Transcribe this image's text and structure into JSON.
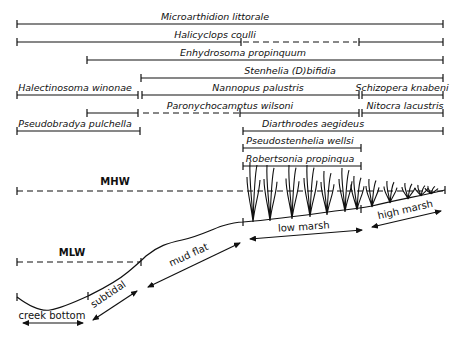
{
  "species": [
    {
      "name": "Microarthidion littorale",
      "label_x": 215,
      "y": 24,
      "segments": [
        {
          "x1": 17,
          "x2": 443,
          "style": "solid"
        }
      ]
    },
    {
      "name": "Halicyclops coulli",
      "label_x": 215,
      "y": 42,
      "segments": [
        {
          "x1": 17,
          "x2": 241,
          "style": "solid"
        },
        {
          "x1": 243,
          "x2": 357,
          "style": "dashed"
        },
        {
          "x1": 359,
          "x2": 443,
          "style": "solid"
        }
      ]
    },
    {
      "name": "Enhydrosoma propinquum",
      "label_x": 243,
      "y": 60,
      "segments": [
        {
          "x1": 87,
          "x2": 443,
          "style": "solid"
        }
      ]
    },
    {
      "name": "Stenhelia (D)bifidia",
      "label_x": 290,
      "y": 78,
      "segments": [
        {
          "x1": 141,
          "x2": 443,
          "style": "solid"
        }
      ]
    },
    {
      "name": "Halectinosoma winonae",
      "label_x": 75,
      "y": 95,
      "segments": [
        {
          "x1": 17,
          "x2": 138,
          "style": "solid"
        }
      ]
    },
    {
      "name": "Nannopus palustris",
      "label_x": 258,
      "y": 95,
      "segments": [
        {
          "x1": 142,
          "x2": 359,
          "style": "solid"
        }
      ]
    },
    {
      "name": "Schizopera knabeni",
      "label_x": 402,
      "y": 95,
      "segments": [
        {
          "x1": 362,
          "x2": 443,
          "style": "solid"
        }
      ]
    },
    {
      "name": "Paronychocamptus wilsoni",
      "label_x": 230,
      "y": 113,
      "segments": [
        {
          "x1": 87,
          "x2": 138,
          "style": "solid"
        },
        {
          "x1": 143,
          "x2": 240,
          "style": "dashed"
        },
        {
          "x1": 240,
          "x2": 359,
          "style": "solid"
        }
      ]
    },
    {
      "name": "Nitocra lacustris",
      "label_x": 405,
      "y": 113,
      "segments": [
        {
          "x1": 362,
          "x2": 443,
          "style": "solid"
        }
      ]
    },
    {
      "name": "Pseudobradya pulchella",
      "label_x": 75,
      "y": 131,
      "segments": [
        {
          "x1": 17,
          "x2": 140,
          "style": "solid"
        }
      ]
    },
    {
      "name": "Diarthrodes aegideus",
      "label_x": 313,
      "y": 131,
      "segments": [
        {
          "x1": 243,
          "x2": 443,
          "style": "solid"
        }
      ]
    },
    {
      "name": "Pseudostenhelia wellsi",
      "label_x": 300,
      "y": 148,
      "segments": [
        {
          "x1": 243,
          "x2": 361,
          "style": "solid"
        }
      ]
    },
    {
      "name": "Robertsonia propinqua",
      "label_x": 300,
      "y": 166,
      "segments": [
        {
          "x1": 243,
          "x2": 361,
          "style": "solid"
        }
      ]
    }
  ],
  "levels": {
    "mhw": {
      "label": "MHW",
      "y": 191,
      "x1": 17,
      "x2": 445
    },
    "mlw": {
      "label": "MLW",
      "y": 262,
      "x1": 17,
      "x2": 140
    }
  },
  "zones": [
    {
      "label": "creek bottom"
    },
    {
      "label": "subtidal"
    },
    {
      "label": "mud flat"
    },
    {
      "label": "low marsh"
    },
    {
      "label": "high marsh"
    }
  ]
}
